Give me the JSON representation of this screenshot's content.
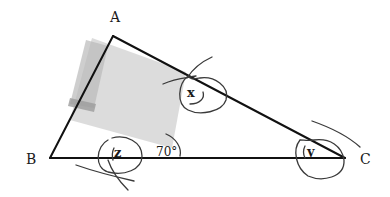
{
  "diagram": {
    "type": "triangle-angles",
    "vertices": [
      {
        "id": "A",
        "label": "A"
      },
      {
        "id": "B",
        "label": "B"
      },
      {
        "id": "C",
        "label": "C"
      }
    ],
    "angles": {
      "x": {
        "label": "x",
        "at": "A-side point on AC"
      },
      "y": {
        "label": "y",
        "at": "C"
      },
      "z": {
        "label": "z",
        "at": "baseline near B"
      },
      "given": {
        "label": "70°",
        "value": 70
      }
    },
    "colors": {
      "line": "#111111",
      "pencil": "#3a3a3a",
      "shade": "#c8c8c8",
      "shade_dark": "#9a9a9a"
    }
  }
}
